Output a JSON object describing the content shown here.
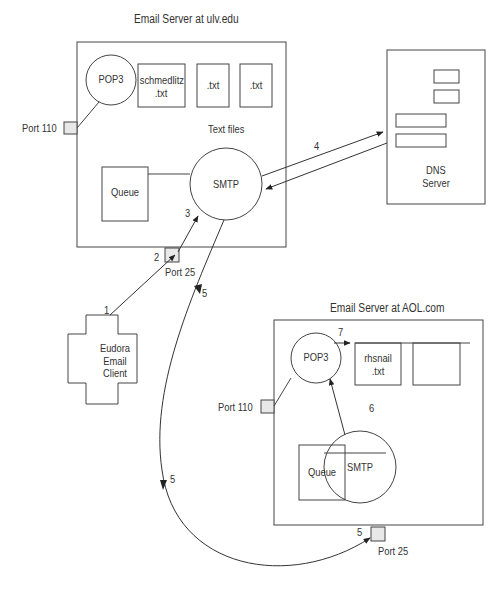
{
  "servers": {
    "ulv": {
      "title": "Email Server at ulv.edu",
      "pop3": "POP3",
      "files": [
        {
          "line1": "schmedlitz",
          "line2": ".txt"
        },
        {
          "line1": ".txt",
          "line2": ""
        },
        {
          "line1": ".txt",
          "line2": ""
        }
      ],
      "files_label": "Text files",
      "smtp": "SMTP",
      "queue": "Queue",
      "port110": "Port 110",
      "port25": "Port 25"
    },
    "aol": {
      "title": "Email Server at AOL.com",
      "pop3": "POP3",
      "files": [
        {
          "line1": "rhsnail",
          "line2": ".txt"
        },
        {
          "line1": "",
          "line2": ""
        }
      ],
      "smtp": "SMTP",
      "queue": "Queue",
      "port110": "Port 110",
      "port25": "Port 25"
    }
  },
  "dns": {
    "line1": "DNS",
    "line2": "Server"
  },
  "client": {
    "line1": "Eudora",
    "line2": "Email",
    "line3": "Client"
  },
  "steps": {
    "s1": "1",
    "s2": "2",
    "s3": "3",
    "s4": "4",
    "s5a": "5",
    "s5b": "5",
    "s5c": "5",
    "s6": "6",
    "s7": "7"
  }
}
